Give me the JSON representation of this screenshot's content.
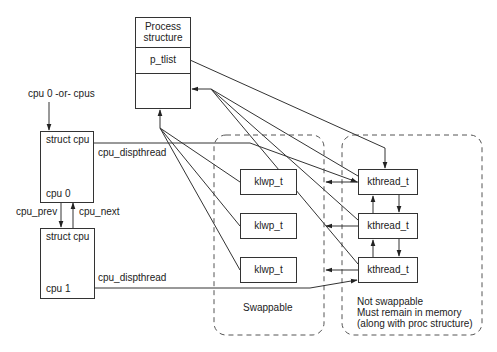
{
  "diagram": {
    "process_structure": {
      "title_line1": "Process",
      "title_line2": "structure",
      "field": "p_tlist"
    },
    "cpu_entry_label": "cpu 0 -or- cpus",
    "cpus": [
      {
        "header": "struct cpu",
        "name": "cpu 0",
        "pointer_label": "cpu_dispthread"
      },
      {
        "header": "struct cpu",
        "name": "cpu 1",
        "pointer_label": "cpu_dispthread"
      }
    ],
    "cpu_links": {
      "prev": "cpu_prev",
      "next": "cpu_next"
    },
    "klwps": [
      "klwp_t",
      "klwp_t",
      "klwp_t"
    ],
    "kthreads": [
      "kthread_t",
      "kthread_t",
      "kthread_t"
    ],
    "regions": {
      "swappable": "Swappable",
      "not_swappable_line1": "Not swappable",
      "not_swappable_line2": "Must remain in memory",
      "not_swappable_line3": "(along with proc structure)"
    }
  }
}
